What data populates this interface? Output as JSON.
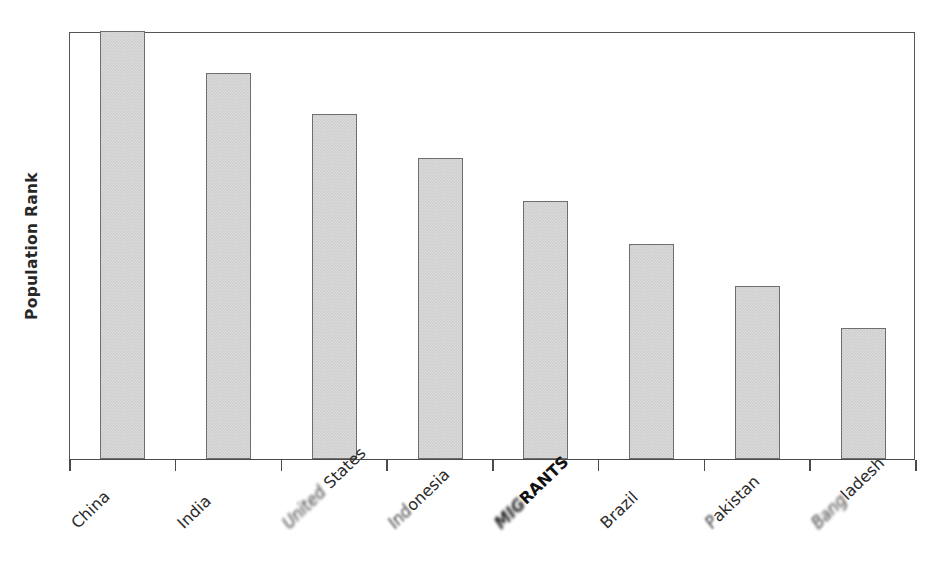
{
  "chart_data": {
    "type": "bar",
    "title": "",
    "xlabel": "",
    "ylabel": "Population Rank",
    "categories": [
      "China",
      "India",
      "United States",
      "Indonesia",
      "MIGRANTS",
      "Brazil",
      "Pakistan",
      "Bangladesh"
    ],
    "values": [
      8.0,
      7.21,
      6.45,
      5.63,
      4.82,
      4.02,
      3.23,
      2.45
    ],
    "value_unit": "relative bar height (rank scale, unlabeled axis)",
    "ylim": [
      0,
      8
    ],
    "grid": false,
    "legend": null,
    "axis_tick_labels_y": []
  },
  "labels": [
    {
      "id": "china",
      "text": "China",
      "bold": false,
      "smudged_prefix": "",
      "clear_suffix": "China"
    },
    {
      "id": "india",
      "text": "India",
      "bold": false,
      "smudged_prefix": "",
      "clear_suffix": "India"
    },
    {
      "id": "united-states",
      "text": "United States",
      "bold": false,
      "smudged_prefix": "United",
      "clear_suffix": " States"
    },
    {
      "id": "indonesia",
      "text": "Indonesia",
      "bold": false,
      "smudged_prefix": "Ind",
      "clear_suffix": "onesia"
    },
    {
      "id": "migrants",
      "text": "MIGRANTS",
      "bold": true,
      "smudged_prefix": "MIG",
      "clear_suffix": "RANTS"
    },
    {
      "id": "brazil",
      "text": "Brazil",
      "bold": false,
      "smudged_prefix": "",
      "clear_suffix": "Brazil"
    },
    {
      "id": "pakistan",
      "text": "Pakistan",
      "bold": false,
      "smudged_prefix": "P",
      "clear_suffix": "akistan"
    },
    {
      "id": "bangladesh",
      "text": "Bangladesh",
      "bold": false,
      "smudged_prefix": "Bang",
      "clear_suffix": "ladesh"
    }
  ],
  "colors": {
    "bar_fill": "#cdcdcd",
    "bar_border": "#6e6e6e",
    "axis": "#4a4a4a",
    "frame": "#555555",
    "text": "#2b2b2b",
    "background": "#ffffff"
  }
}
